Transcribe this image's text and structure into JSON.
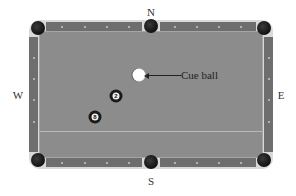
{
  "compass": {
    "north": "N",
    "south": "S",
    "west": "W",
    "east": "E"
  },
  "table": {
    "felt_color": "#8c8c8c",
    "rail_color": "#6e6e6e",
    "frame_color": "#d9d9d9",
    "pockets": [
      "top-left-corner",
      "top-side",
      "top-right-corner",
      "bottom-left-corner",
      "bottom-side",
      "bottom-right-corner"
    ],
    "has_head_string_line": true
  },
  "balls": [
    {
      "id": "cue",
      "label": "",
      "color": "#ffffff"
    },
    {
      "id": "ball-2",
      "label": "2",
      "color": "#1a1a1a"
    },
    {
      "id": "ball-8",
      "label": "8",
      "color": "#1a1a1a"
    }
  ],
  "annotation": {
    "text": "Cue ball",
    "points_to": "cue"
  }
}
